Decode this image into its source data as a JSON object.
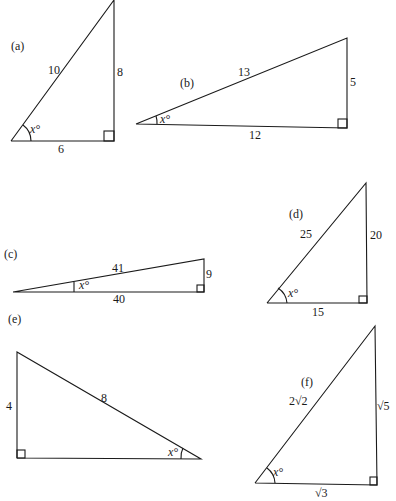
{
  "figure": {
    "triangles": [
      {
        "id": "a",
        "label": "(a)",
        "hypotenuse": "10",
        "opposite": "8",
        "adjacent": "6",
        "angle": "x°"
      },
      {
        "id": "b",
        "label": "(b)",
        "hypotenuse": "13",
        "opposite": "5",
        "adjacent": "12",
        "angle": "x°"
      },
      {
        "id": "c",
        "label": "(c)",
        "hypotenuse": "41",
        "opposite": "9",
        "adjacent": "40",
        "angle": "x°"
      },
      {
        "id": "d",
        "label": "(d)",
        "hypotenuse": "25",
        "opposite": "20",
        "adjacent": "15",
        "angle": "x°"
      },
      {
        "id": "e",
        "label": "(e)",
        "hypotenuse": "8",
        "opposite": "4",
        "angle": "x°"
      },
      {
        "id": "f",
        "label": "(f)",
        "hypotenuse": "2√2",
        "opposite": "√5",
        "adjacent": "√3",
        "angle": "x°"
      }
    ]
  }
}
